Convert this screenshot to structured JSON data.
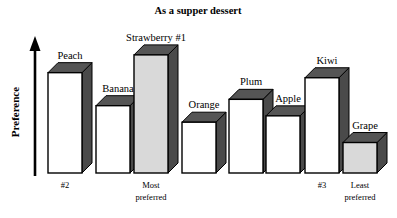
{
  "chart_data": {
    "type": "bar",
    "title": "As a supper dessert",
    "xlabel": "",
    "ylabel": "Preference",
    "grid": false,
    "legend": false,
    "axis_style": "arrow-up-no-ticks",
    "ylim": [
      0,
      100
    ],
    "categories": [
      "Peach",
      "Banana",
      "Strawberry #1",
      "Orange",
      "Plum",
      "Apple",
      "Kiwi",
      "Grape"
    ],
    "values": [
      79,
      53,
      93,
      40,
      58,
      45,
      75,
      24
    ],
    "bottom_labels": [
      "#2",
      "",
      "Most preferred",
      "",
      "",
      "",
      "#3",
      "Least preferred"
    ],
    "bar_fills": [
      "#ffffff",
      "#ffffff",
      "#d9d9d9",
      "#ffffff",
      "#ffffff",
      "#ffffff",
      "#ffffff",
      "#d9d9d9"
    ],
    "annotations": [
      "Strawberry #1 is the most preferred",
      "Peach is ranked #2",
      "Kiwi is ranked #3",
      "Grape is least preferred"
    ]
  },
  "title": {
    "text": "As a supper dessert"
  },
  "yaxis": {
    "label": "Preference",
    "arrow": "arrow-up-icon"
  },
  "bars": [
    {
      "name": "peach",
      "label": "Peach",
      "bottom_label": "#2",
      "bottom_label_2": "",
      "value": 79,
      "fill": "#ffffff"
    },
    {
      "name": "banana",
      "label": "Banana",
      "bottom_label": "",
      "bottom_label_2": "",
      "value": 53,
      "fill": "#ffffff"
    },
    {
      "name": "strawberry",
      "label": "Strawberry #1",
      "bottom_label": "Most",
      "bottom_label_2": "preferred",
      "value": 93,
      "fill": "#d9d9d9"
    },
    {
      "name": "orange",
      "label": "Orange",
      "bottom_label": "",
      "bottom_label_2": "",
      "value": 40,
      "fill": "#ffffff"
    },
    {
      "name": "plum",
      "label": "Plum",
      "bottom_label": "",
      "bottom_label_2": "",
      "value": 58,
      "fill": "#ffffff"
    },
    {
      "name": "apple",
      "label": "Apple",
      "bottom_label": "",
      "bottom_label_2": "",
      "value": 45,
      "fill": "#ffffff"
    },
    {
      "name": "kiwi",
      "label": "Kiwi",
      "bottom_label": "#3",
      "bottom_label_2": "",
      "value": 75,
      "fill": "#ffffff"
    },
    {
      "name": "grape",
      "label": "Grape",
      "bottom_label": "Least",
      "bottom_label_2": "preferred",
      "value": 24,
      "fill": "#d9d9d9"
    }
  ],
  "colors": {
    "ink": "#000000",
    "bar_outline": "#000000",
    "bar_shade": "#4a4a4a",
    "bar_top_shade": "#555555",
    "bar_face_white": "#ffffff",
    "bar_face_gray": "#d9d9d9",
    "background": "#ffffff"
  }
}
